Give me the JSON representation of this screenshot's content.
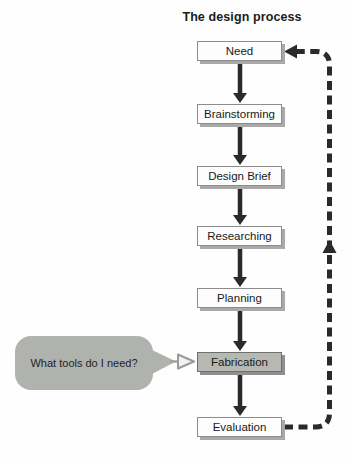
{
  "title": "The design process",
  "steps": [
    {
      "label": "Need",
      "highlighted": false
    },
    {
      "label": "Brainstorming",
      "highlighted": false
    },
    {
      "label": "Design Brief",
      "highlighted": false
    },
    {
      "label": "Researching",
      "highlighted": false
    },
    {
      "label": "Planning",
      "highlighted": false
    },
    {
      "label": "Fabrication",
      "highlighted": true
    },
    {
      "label": "Evaluation",
      "highlighted": false
    }
  ],
  "flow": {
    "forward_connector": "solid-down-arrow",
    "feedback_loop": {
      "style": "dashed",
      "from": "Evaluation",
      "to": "Need"
    }
  },
  "callout": {
    "text": "What tools do I need?",
    "points_to": "Fabrication"
  },
  "colors": {
    "background": "#fefefe",
    "box_fill": "#fdfdfd",
    "box_highlight_fill": "#b6b8b2",
    "box_border": "#8c8c8c",
    "box_shadow": "#a9a9a9",
    "arrow": "#2a2a2a",
    "dashed_line": "#2a2a2a",
    "callout_fill": "#b0b2ae",
    "text": "#1a1a1a"
  }
}
